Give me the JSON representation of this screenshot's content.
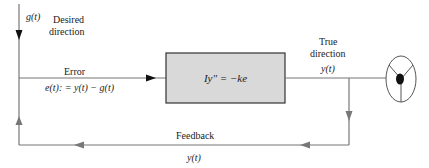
{
  "diagram": {
    "input": {
      "signal": "g(t)",
      "label_line1": "Desired",
      "label_line2": "direction"
    },
    "error": {
      "label": "Error",
      "equation": "e(t): = y(t) − g(t)"
    },
    "plant": {
      "equation": "Iy″ = −ke",
      "fill": "#d9d9d9"
    },
    "output": {
      "label_line1": "True",
      "label_line2": "direction",
      "signal": "y(t)"
    },
    "feedback": {
      "label": "Feedback",
      "signal": "y(t)"
    },
    "actuator": {
      "icon": "steering-wheel-icon"
    },
    "colors": {
      "line": "#777777",
      "box_border": "#333333",
      "box_fill": "#d9d9d9",
      "arrow": "#111111"
    }
  }
}
